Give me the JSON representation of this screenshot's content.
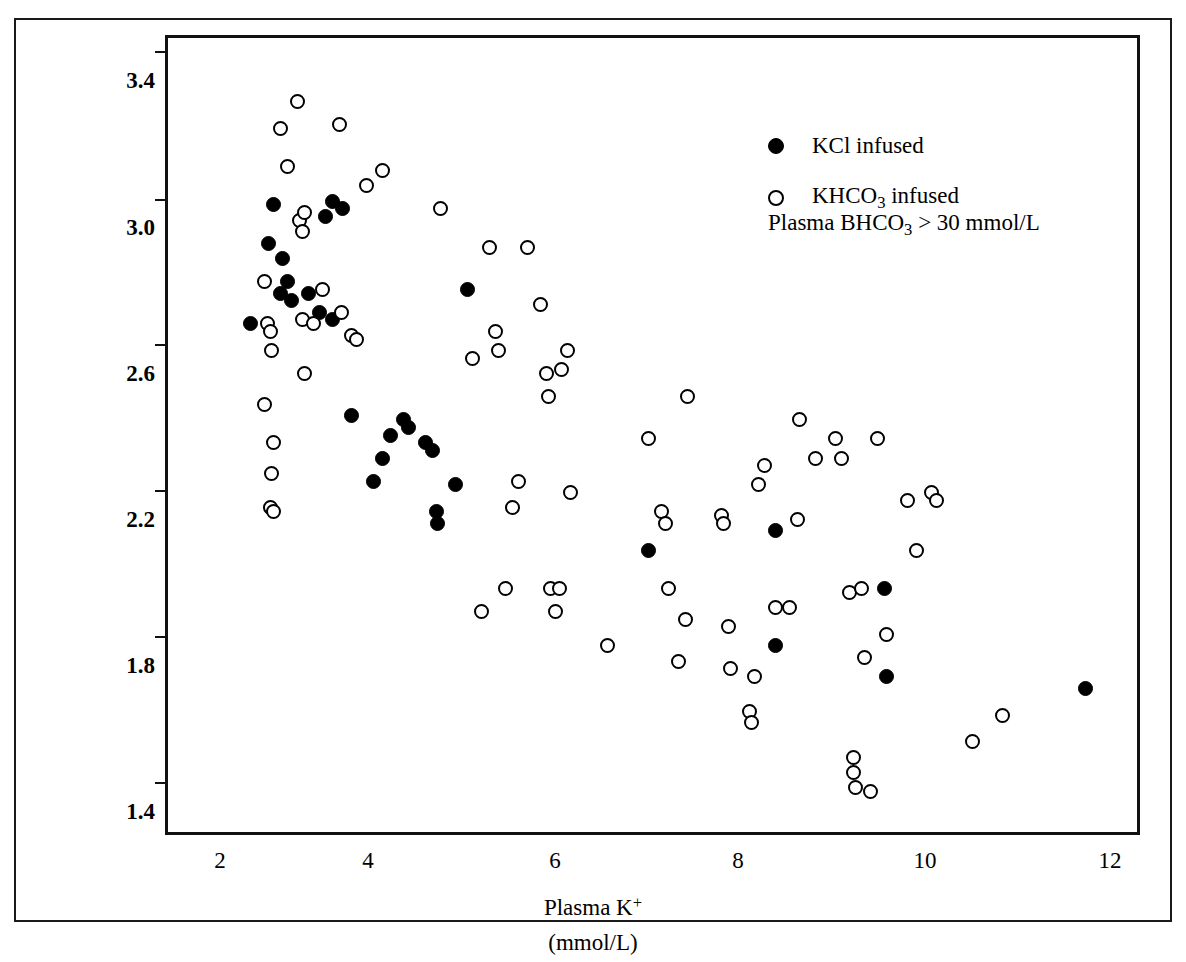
{
  "figure": {
    "background": "#ffffff",
    "axis_color": "#111111",
    "marker_color": "#000000"
  },
  "legend": {
    "position": "top-right",
    "entries": [
      {
        "marker": "filled-circle-icon",
        "label": "KCl infused"
      },
      {
        "marker": "open-circle-icon",
        "label": "KHCO3 infused"
      }
    ],
    "kcl_label": "KCl infused",
    "khco3_label_pre": "KHCO",
    "khco3_label_sub": "3",
    "khco3_label_post": " infused"
  },
  "annotation": {
    "pre": "Plasma BHCO",
    "sub": "3",
    "post": " > 30 mmol/L",
    "full": "Plasma BHCO3 > 30 mmol/L"
  },
  "axes": {
    "x": {
      "title_pre": "Plasma K",
      "title_sup": "+",
      "units": "(mmol/L)",
      "ticks": [
        "2",
        "4",
        "6",
        "8",
        "10",
        "12"
      ],
      "tick_values": [
        2,
        4,
        6,
        8,
        10,
        12
      ],
      "range": [
        1.4,
        12.6
      ]
    },
    "y": {
      "title_line1_pre": "BHCO",
      "title_line1_sub": "3",
      "title_line1_post": " reabsorbed",
      "title_line2": "(mmol/100 ml glom. filtrate)",
      "ticks": [
        "3.4",
        "3.0",
        "2.6",
        "2.2",
        "1.8",
        "1.4"
      ],
      "tick_values": [
        3.4,
        3.0,
        2.6,
        2.2,
        1.8,
        1.4
      ],
      "range": [
        1.365,
        3.435
      ]
    }
  },
  "chart_data": {
    "type": "scatter",
    "title": "",
    "xlabel": "Plasma K+ (mmol/L)",
    "ylabel": "BHCO3 reabsorbed (mmol/100 ml glom. filtrate)",
    "xlim": [
      1.4,
      12.6
    ],
    "ylim": [
      1.365,
      3.435
    ],
    "grid": false,
    "legend_position": "top-right",
    "annotation": "Plasma BHCO3 > 30 mmol/L",
    "series": [
      {
        "name": "KCl infused",
        "marker": "filled-circle",
        "color": "#000000",
        "points": [
          [
            2.35,
            2.69
          ],
          [
            2.62,
            3.0
          ],
          [
            2.56,
            2.9
          ],
          [
            2.72,
            2.86
          ],
          [
            2.7,
            2.77
          ],
          [
            2.78,
            2.8
          ],
          [
            2.83,
            2.75
          ],
          [
            3.02,
            2.77
          ],
          [
            3.15,
            2.72
          ],
          [
            3.3,
            3.01
          ],
          [
            3.22,
            2.97
          ],
          [
            3.42,
            2.99
          ],
          [
            3.3,
            2.7
          ],
          [
            3.52,
            2.45
          ],
          [
            3.78,
            2.28
          ],
          [
            3.88,
            2.34
          ],
          [
            3.97,
            2.4
          ],
          [
            4.12,
            2.44
          ],
          [
            4.18,
            2.42
          ],
          [
            4.38,
            2.38
          ],
          [
            4.46,
            2.36
          ],
          [
            4.5,
            2.2
          ],
          [
            4.52,
            2.17
          ],
          [
            4.72,
            2.27
          ],
          [
            4.86,
            2.78
          ],
          [
            6.95,
            2.1
          ],
          [
            8.42,
            1.85
          ],
          [
            8.42,
            2.15
          ],
          [
            9.68,
            2.0
          ],
          [
            9.7,
            1.77
          ],
          [
            12.0,
            1.74
          ]
        ]
      },
      {
        "name": "KHCO3 infused",
        "marker": "open-circle",
        "color": "#000000",
        "points": [
          [
            2.52,
            2.48
          ],
          [
            2.52,
            2.8
          ],
          [
            2.55,
            2.69
          ],
          [
            2.58,
            2.67
          ],
          [
            2.6,
            2.62
          ],
          [
            2.62,
            2.38
          ],
          [
            2.6,
            2.3
          ],
          [
            2.58,
            2.21
          ],
          [
            2.62,
            2.2
          ],
          [
            2.7,
            3.2
          ],
          [
            2.78,
            3.1
          ],
          [
            2.9,
            3.27
          ],
          [
            2.92,
            2.96
          ],
          [
            2.95,
            2.93
          ],
          [
            2.98,
            2.98
          ],
          [
            2.95,
            2.7
          ],
          [
            2.98,
            2.56
          ],
          [
            3.08,
            2.69
          ],
          [
            3.18,
            2.78
          ],
          [
            3.38,
            3.21
          ],
          [
            3.4,
            2.72
          ],
          [
            3.52,
            2.66
          ],
          [
            3.58,
            2.65
          ],
          [
            3.7,
            3.05
          ],
          [
            3.88,
            3.09
          ],
          [
            4.55,
            2.99
          ],
          [
            4.92,
            2.6
          ],
          [
            5.02,
            1.94
          ],
          [
            5.12,
            2.89
          ],
          [
            5.18,
            2.67
          ],
          [
            5.22,
            2.62
          ],
          [
            5.3,
            2.0
          ],
          [
            5.38,
            2.21
          ],
          [
            5.45,
            2.28
          ],
          [
            5.55,
            2.89
          ],
          [
            5.7,
            2.74
          ],
          [
            5.78,
            2.56
          ],
          [
            5.8,
            2.5
          ],
          [
            5.82,
            2.0
          ],
          [
            5.92,
            2.0
          ],
          [
            5.88,
            1.94
          ],
          [
            5.95,
            2.57
          ],
          [
            6.02,
            2.62
          ],
          [
            6.05,
            2.25
          ],
          [
            6.48,
            1.85
          ],
          [
            6.95,
            2.39
          ],
          [
            7.1,
            2.2
          ],
          [
            7.15,
            2.17
          ],
          [
            7.18,
            2.0
          ],
          [
            7.3,
            1.81
          ],
          [
            7.38,
            1.92
          ],
          [
            7.4,
            2.5
          ],
          [
            7.8,
            2.19
          ],
          [
            7.82,
            2.17
          ],
          [
            7.88,
            1.9
          ],
          [
            7.9,
            1.79
          ],
          [
            8.12,
            1.68
          ],
          [
            8.14,
            1.65
          ],
          [
            8.18,
            1.77
          ],
          [
            8.22,
            2.27
          ],
          [
            8.3,
            2.32
          ],
          [
            8.42,
            1.95
          ],
          [
            8.58,
            1.95
          ],
          [
            8.68,
            2.18
          ],
          [
            8.7,
            2.44
          ],
          [
            8.88,
            2.34
          ],
          [
            9.12,
            2.39
          ],
          [
            9.18,
            2.34
          ],
          [
            9.28,
            1.99
          ],
          [
            9.32,
            1.56
          ],
          [
            9.32,
            1.52
          ],
          [
            9.35,
            1.48
          ],
          [
            9.42,
            2.0
          ],
          [
            9.45,
            1.82
          ],
          [
            9.52,
            1.47
          ],
          [
            9.6,
            2.39
          ],
          [
            9.7,
            1.88
          ],
          [
            9.95,
            2.23
          ],
          [
            10.05,
            2.1
          ],
          [
            10.22,
            2.25
          ],
          [
            10.28,
            2.23
          ],
          [
            10.7,
            1.6
          ],
          [
            11.05,
            1.67
          ]
        ]
      }
    ]
  }
}
